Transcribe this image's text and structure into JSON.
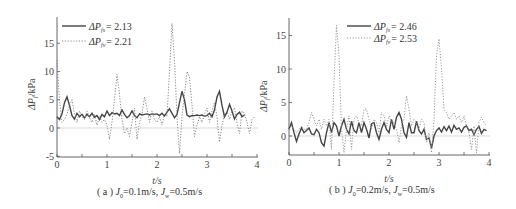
{
  "chart_data": [
    {
      "type": "line",
      "panel": "a",
      "caption": "( a ) J_0=0.1m/s, J_w=0.5m/s",
      "caption_parts": {
        "prefix": "( a ) ",
        "j0": "J",
        "j0_sub": "0",
        "j0_val": "=0.1m/s, ",
        "jw": "J",
        "jw_sub": "w",
        "jw_val": "=0.5m/s"
      },
      "xlabel": "t/s",
      "ylabel": "ΔP_f/kPa",
      "xlim": [
        0,
        4
      ],
      "ylim": [
        -5,
        19
      ],
      "xticks": [
        0,
        1,
        2,
        3,
        4
      ],
      "yticks": [
        -5,
        0,
        5,
        10,
        15
      ],
      "reference_line": 0,
      "legend_position": "upper left",
      "series": [
        {
          "name": "ΔP_fs = 2.13",
          "label_main": "ΔP",
          "label_sub": "fs",
          "label_value": "= 2.13",
          "style": "solid",
          "x": [
            0,
            0.05,
            0.1,
            0.15,
            0.2,
            0.25,
            0.3,
            0.35,
            0.4,
            0.45,
            0.5,
            0.55,
            0.6,
            0.65,
            0.7,
            0.75,
            0.8,
            0.85,
            0.9,
            0.95,
            1.0,
            1.05,
            1.1,
            1.15,
            1.2,
            1.25,
            1.3,
            1.35,
            1.4,
            1.45,
            1.5,
            1.55,
            1.6,
            1.65,
            1.7,
            1.75,
            1.8,
            1.85,
            1.9,
            1.95,
            2.0,
            2.05,
            2.1,
            2.15,
            2.2,
            2.25,
            2.3,
            2.35,
            2.4,
            2.45,
            2.5,
            2.55,
            2.6,
            2.65,
            2.7,
            2.75,
            2.8,
            2.85,
            2.9,
            2.95,
            3.0,
            3.05,
            3.1,
            3.15,
            3.2,
            3.25,
            3.3,
            3.35,
            3.4,
            3.45,
            3.5,
            3.55,
            3.6,
            3.65,
            3.7,
            3.75,
            3.8,
            3.85,
            3.9,
            3.95
          ],
          "values": [
            2.0,
            1.5,
            2.5,
            4.5,
            5.5,
            4.0,
            2.2,
            1.6,
            2.6,
            2.0,
            2.4,
            1.8,
            2.4,
            2.0,
            2.6,
            1.9,
            2.2,
            1.5,
            2.4,
            2.0,
            3.0,
            2.2,
            2.7,
            2.5,
            2.6,
            2.2,
            3.2,
            2.4,
            1.8,
            2.2,
            3.0,
            2.2,
            1.8,
            2.5,
            2.3,
            2.4,
            2.5,
            2.3,
            2.5,
            2.4,
            2.5,
            2.2,
            2.6,
            2.1,
            2.8,
            3.4,
            2.6,
            1.8,
            2.4,
            4.5,
            6.5,
            5.0,
            2.3,
            2.0,
            2.2,
            2.2,
            2.3,
            2.2,
            2.3,
            2.1,
            2.2,
            2.6,
            2.0,
            3.2,
            5.5,
            6.5,
            4.0,
            2.0,
            2.8,
            4.2,
            3.0,
            1.6,
            2.4,
            2.8,
            2.0,
            2.3
          ],
          "color": "#444444"
        },
        {
          "name": "ΔP_fv = 2.21",
          "label_main": "ΔP",
          "label_sub": "fv",
          "label_value": "= 2.21",
          "style": "dotted",
          "x": [
            0,
            0.05,
            0.1,
            0.15,
            0.2,
            0.25,
            0.3,
            0.35,
            0.4,
            0.45,
            0.5,
            0.55,
            0.6,
            0.65,
            0.7,
            0.75,
            0.8,
            0.85,
            0.9,
            0.95,
            1.0,
            1.05,
            1.1,
            1.15,
            1.2,
            1.25,
            1.3,
            1.35,
            1.4,
            1.45,
            1.5,
            1.55,
            1.6,
            1.65,
            1.7,
            1.75,
            1.8,
            1.85,
            1.9,
            1.95,
            2.0,
            2.05,
            2.1,
            2.15,
            2.2,
            2.25,
            2.3,
            2.35,
            2.4,
            2.45,
            2.5,
            2.55,
            2.6,
            2.65,
            2.7,
            2.75,
            2.8,
            2.85,
            2.9,
            2.95,
            3.0,
            3.05,
            3.1,
            3.15,
            3.2,
            3.25,
            3.3,
            3.35,
            3.4,
            3.45,
            3.5,
            3.55,
            3.6,
            3.65,
            3.7,
            3.75,
            3.8,
            3.85,
            3.9,
            3.95
          ],
          "values": [
            12.0,
            5.0,
            1.0,
            1.5,
            2.5,
            4.0,
            5.0,
            2.5,
            1.0,
            3.0,
            2.0,
            1.5,
            3.0,
            1.8,
            1.0,
            2.5,
            0.5,
            2.0,
            1.0,
            1.5,
            0.5,
            -2.0,
            1.0,
            5.0,
            9.5,
            6.0,
            1.5,
            -1.0,
            0.0,
            -1.5,
            1.0,
            3.5,
            -2.0,
            1.0,
            2.5,
            5.5,
            3.5,
            1.0,
            3.0,
            1.5,
            1.0,
            2.0,
            0.5,
            2.5,
            2.0,
            10.0,
            18.5,
            12.0,
            2.0,
            -4.5,
            2.0,
            6.0,
            10.0,
            9.0,
            4.0,
            -1.5,
            0.5,
            2.0,
            1.0,
            2.5,
            3.5,
            1.0,
            3.0,
            4.5,
            2.0,
            -2.5,
            0.5,
            2.5,
            3.0,
            1.5,
            3.0,
            3.5,
            1.0,
            -1.0,
            3.0,
            2.5,
            1.0,
            -1.0,
            1.5,
            2.0
          ],
          "color": "#777777"
        }
      ]
    },
    {
      "type": "line",
      "panel": "b",
      "caption": "( b ) J_0=0.2m/s, J_w=0.5m/s",
      "caption_parts": {
        "prefix": "( b ) ",
        "j0": "J",
        "j0_sub": "0",
        "j0_val": "=0.2m/s, ",
        "jw": "J",
        "jw_sub": "w",
        "jw_val": "=0.5m/s"
      },
      "xlabel": "t/s",
      "ylabel": "ΔP_f/kPa",
      "xlim": [
        0,
        4
      ],
      "ylim": [
        -3,
        17.5
      ],
      "xticks": [
        0,
        1,
        2,
        3,
        4
      ],
      "yticks": [
        0,
        5,
        10,
        15
      ],
      "reference_line": 0,
      "legend_position": "upper center",
      "series": [
        {
          "name": "ΔP_fs = 2.46",
          "label_main": "ΔP",
          "label_sub": "fs",
          "label_value": "= 2.46",
          "style": "solid",
          "x": [
            0,
            0.05,
            0.1,
            0.15,
            0.2,
            0.25,
            0.3,
            0.35,
            0.4,
            0.45,
            0.5,
            0.55,
            0.6,
            0.65,
            0.7,
            0.75,
            0.8,
            0.85,
            0.9,
            0.95,
            1.0,
            1.05,
            1.1,
            1.15,
            1.2,
            1.25,
            1.3,
            1.35,
            1.4,
            1.45,
            1.5,
            1.55,
            1.6,
            1.65,
            1.7,
            1.75,
            1.8,
            1.85,
            1.9,
            1.95,
            2.0,
            2.05,
            2.1,
            2.15,
            2.2,
            2.25,
            2.3,
            2.35,
            2.4,
            2.45,
            2.5,
            2.55,
            2.6,
            2.65,
            2.7,
            2.75,
            2.8,
            2.85,
            2.9,
            2.95,
            3.0,
            3.05,
            3.1,
            3.15,
            3.2,
            3.25,
            3.3,
            3.35,
            3.4,
            3.45,
            3.5,
            3.55,
            3.6,
            3.65,
            3.7,
            3.75,
            3.8,
            3.85,
            3.9,
            3.95
          ],
          "values": [
            1.0,
            2.0,
            0.5,
            -0.8,
            0.3,
            1.2,
            0.5,
            0.8,
            1.2,
            0.3,
            0.2,
            1.0,
            0.5,
            -1.0,
            -1.5,
            0.5,
            2.0,
            0.5,
            2.0,
            1.5,
            0.0,
            1.5,
            2.5,
            1.0,
            0.3,
            2.2,
            0.8,
            0.5,
            2.0,
            0.5,
            2.0,
            1.0,
            -0.3,
            1.8,
            2.0,
            0.5,
            -0.5,
            1.0,
            2.0,
            1.0,
            0.5,
            2.5,
            1.0,
            2.8,
            3.5,
            2.5,
            0.5,
            -0.2,
            2.0,
            0.5,
            0.5,
            2.2,
            0.8,
            0.3,
            1.0,
            -0.5,
            -0.3,
            -1.8,
            0.0,
            0.8,
            1.2,
            0.6,
            1.4,
            0.8,
            1.5,
            0.6,
            1.6,
            1.0,
            1.2,
            0.6,
            1.3,
            1.5,
            0.8,
            1.0,
            0.2,
            1.0,
            1.4,
            0.4,
            1.0,
            0.8
          ],
          "color": "#444444"
        },
        {
          "name": "ΔP_fv = 2.53",
          "label_main": "ΔP",
          "label_sub": "fv",
          "label_value": "= 2.53",
          "style": "dotted",
          "x": [
            0,
            0.05,
            0.1,
            0.15,
            0.2,
            0.25,
            0.3,
            0.35,
            0.4,
            0.45,
            0.5,
            0.55,
            0.6,
            0.65,
            0.7,
            0.75,
            0.8,
            0.85,
            0.9,
            0.95,
            1.0,
            1.05,
            1.1,
            1.15,
            1.2,
            1.25,
            1.3,
            1.35,
            1.4,
            1.45,
            1.5,
            1.55,
            1.6,
            1.65,
            1.7,
            1.75,
            1.8,
            1.85,
            1.9,
            1.95,
            2.0,
            2.05,
            2.1,
            2.15,
            2.2,
            2.25,
            2.3,
            2.35,
            2.4,
            2.45,
            2.5,
            2.55,
            2.6,
            2.65,
            2.7,
            2.75,
            2.8,
            2.85,
            2.9,
            2.95,
            3.0,
            3.05,
            3.1,
            3.15,
            3.2,
            3.25,
            3.3,
            3.35,
            3.4,
            3.45,
            3.5,
            3.55,
            3.6,
            3.65,
            3.7,
            3.75,
            3.8,
            3.85,
            3.9,
            3.95
          ],
          "values": [
            1.0,
            1.5,
            1.0,
            0.5,
            1.0,
            1.5,
            1.0,
            1.0,
            2.0,
            3.5,
            2.5,
            1.5,
            2.5,
            1.0,
            2.5,
            1.5,
            2.5,
            -2.0,
            8.0,
            16.5,
            12.0,
            1.0,
            -2.5,
            1.0,
            3.0,
            -2.0,
            2.5,
            3.0,
            2.0,
            1.5,
            4.0,
            4.0,
            2.5,
            1.0,
            2.5,
            2.0,
            0.5,
            3.5,
            3.0,
            1.5,
            3.0,
            2.0,
            2.0,
            1.0,
            -1.0,
            1.5,
            2.5,
            6.0,
            4.0,
            1.5,
            2.5,
            2.0,
            1.0,
            2.5,
            2.0,
            -1.0,
            0.5,
            -2.5,
            2.5,
            12.0,
            14.5,
            10.0,
            4.0,
            3.5,
            2.5,
            3.0,
            3.5,
            2.5,
            3.0,
            2.0,
            3.0,
            1.5,
            0.5,
            -2.0,
            1.5,
            -2.5,
            2.0,
            2.8,
            2.0,
            1.5
          ],
          "color": "#888888"
        }
      ]
    }
  ],
  "panels": {
    "a": {
      "xlabel": "t/s",
      "ylabel_main": "ΔP",
      "ylabel_sub": "f",
      "ylabel_unit": "/kPa",
      "yticks": [
        "-5",
        "0",
        "5",
        "10",
        "15"
      ],
      "xticks": [
        "0",
        "1",
        "2",
        "3",
        "4"
      ],
      "legend": [
        {
          "main": "ΔP",
          "sub": "fs",
          "value": "= 2.13"
        },
        {
          "main": "ΔP",
          "sub": "fv",
          "value": "= 2.21"
        }
      ],
      "caption_prefix": "( a ) ",
      "caption_j": "J",
      "caption_sub0": "0",
      "caption_mid": "=0.1m/s, ",
      "caption_subw": "w",
      "caption_end": "=0.5m/s"
    },
    "b": {
      "xlabel": "t/s",
      "ylabel_main": "ΔP",
      "ylabel_sub": "f",
      "ylabel_unit": "/kPa",
      "yticks": [
        "0",
        "5",
        "10",
        "15"
      ],
      "xticks": [
        "0",
        "1",
        "2",
        "3",
        "4"
      ],
      "legend": [
        {
          "main": "ΔP",
          "sub": "fs",
          "value": "= 2.46"
        },
        {
          "main": "ΔP",
          "sub": "fv",
          "value": "= 2.53"
        }
      ],
      "caption_prefix": "( b ) ",
      "caption_j": "J",
      "caption_sub0": "0",
      "caption_mid": "=0.2m/s, ",
      "caption_subw": "w",
      "caption_end": "=0.5m/s"
    }
  }
}
